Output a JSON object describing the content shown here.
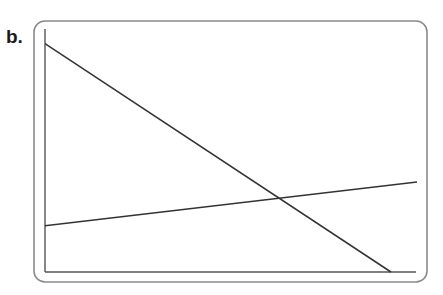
{
  "panel": {
    "label": "b."
  },
  "chart_data": {
    "type": "line",
    "title": "",
    "xlabel": "",
    "ylabel": "",
    "x_ticks": [],
    "y_ticks": [],
    "grid": false,
    "legend": null,
    "xlim": [
      0,
      1
    ],
    "ylim": [
      0,
      1
    ],
    "series": [
      {
        "name": "decreasing line",
        "x": [
          0,
          0.93
        ],
        "y": [
          0.94,
          0.0
        ]
      },
      {
        "name": "increasing line",
        "x": [
          0,
          1.0
        ],
        "y": [
          0.19,
          0.37
        ]
      }
    ],
    "annotations": [
      "lines intersect near x≈0.63, y≈0.30"
    ]
  },
  "colors": {
    "line": "#333333",
    "axis": "#555555",
    "frame": "#8a8a8a"
  }
}
